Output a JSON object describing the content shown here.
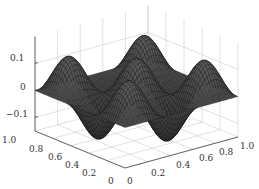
{
  "chart_data": {
    "type": "surface",
    "title": "",
    "xlabel": "",
    "ylabel": "",
    "zlabel": "",
    "x_range": [
      0,
      1
    ],
    "y_range": [
      0,
      1
    ],
    "z_range": [
      -0.15,
      0.15
    ],
    "x_ticks": [
      "0",
      "0.2",
      "0.4",
      "0.6",
      "0.8",
      "1.0"
    ],
    "y_ticks": [
      "0",
      "0.2",
      "0.4",
      "0.6",
      "0.8",
      "1.0"
    ],
    "z_ticks": [
      "-0.1",
      "0",
      "0.1"
    ],
    "function_description": "z ≈ 0.13·sin(3πx)·sin(3πy) rendered as a dark wireframe mesh",
    "amplitude": 0.13,
    "frequency_half_waves": 3,
    "grid": true,
    "mesh_color": "#1a1a1a",
    "face_color": "#555555",
    "grid_color": "#cccccc"
  }
}
